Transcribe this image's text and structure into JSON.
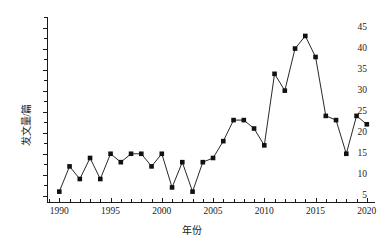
{
  "chart_data": {
    "type": "line",
    "title": "",
    "xlabel": "年份",
    "ylabel": "发文量/篇",
    "xlim": [
      1988.8,
      2020.8
    ],
    "ylim": [
      3.3,
      47.5
    ],
    "grid": false,
    "legend": "none",
    "marker": "filled-square",
    "x_ticks": [
      1990,
      1995,
      2000,
      2005,
      2010,
      2015,
      2020
    ],
    "x_tick_labels": [
      "1990",
      "1995",
      "2000",
      "2005",
      "2010",
      "2015",
      "2020"
    ],
    "x_minor_tick_step": 1,
    "y_ticks": [
      5,
      10,
      15,
      20,
      25,
      30,
      35,
      40,
      45
    ],
    "y_tick_labels": [
      "5",
      "10",
      "15",
      "20",
      "25",
      "30",
      "35",
      "40",
      "45"
    ],
    "y_minor_tick_step": 2.5,
    "series": [
      {
        "name": "发文量",
        "color": "#111111",
        "x": [
          1990,
          1991,
          1992,
          1993,
          1994,
          1995,
          1996,
          1997,
          1998,
          1999,
          2000,
          2001,
          2002,
          2003,
          2004,
          2005,
          2006,
          2007,
          2008,
          2009,
          2010,
          2011,
          2012,
          2013,
          2014,
          2015,
          2016,
          2017,
          2018,
          2019,
          2020
        ],
        "values": [
          6,
          12,
          9,
          14,
          9,
          15,
          13,
          15,
          15,
          12,
          15,
          7,
          13,
          6,
          13,
          14,
          18,
          23,
          23,
          21,
          17,
          34,
          30,
          40,
          43,
          38,
          24,
          23,
          15,
          24,
          22
        ]
      }
    ]
  },
  "axes": {
    "y_axis_title": "发文量/篇",
    "x_axis_title": "年份"
  }
}
